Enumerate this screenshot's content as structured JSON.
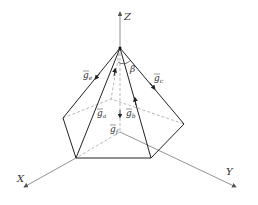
{
  "diagram": {
    "type": "pyramid-vector-diagram",
    "axes": {
      "x": "X",
      "y": "Y",
      "z": "Z"
    },
    "angle_label": "β",
    "vectors": [
      {
        "base": "g",
        "sub": "e"
      },
      {
        "base": "g",
        "sub": "c"
      },
      {
        "base": "g",
        "sub": "a"
      },
      {
        "base": "g",
        "sub": "b"
      },
      {
        "base": "g",
        "sub": "f"
      }
    ],
    "colors": {
      "solid": "#222222",
      "dashed": "#888888",
      "axis": "#666666"
    }
  }
}
